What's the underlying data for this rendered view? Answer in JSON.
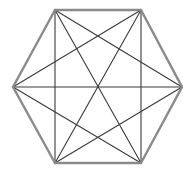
{
  "diagram": {
    "title": "",
    "shape": "hexagon",
    "colors": {
      "background": "#ffffff",
      "edge": "#8a8a8a",
      "diagonal": "#3a3a3a"
    },
    "vertices": [
      {
        "id": "A",
        "x": 55,
        "y": 10
      },
      {
        "id": "B",
        "x": 141,
        "y": 10
      },
      {
        "id": "C",
        "x": 182,
        "y": 87
      },
      {
        "id": "D",
        "x": 141,
        "y": 163
      },
      {
        "id": "E",
        "x": 55,
        "y": 163
      },
      {
        "id": "F",
        "x": 13,
        "y": 87
      }
    ],
    "edges": [
      [
        "A",
        "B"
      ],
      [
        "B",
        "C"
      ],
      [
        "C",
        "D"
      ],
      [
        "D",
        "E"
      ],
      [
        "E",
        "F"
      ],
      [
        "F",
        "A"
      ]
    ],
    "diagonals": [
      [
        "A",
        "C"
      ],
      [
        "A",
        "D"
      ],
      [
        "A",
        "E"
      ],
      [
        "B",
        "D"
      ],
      [
        "B",
        "E"
      ],
      [
        "B",
        "F"
      ],
      [
        "C",
        "E"
      ],
      [
        "C",
        "F"
      ],
      [
        "D",
        "F"
      ]
    ]
  }
}
